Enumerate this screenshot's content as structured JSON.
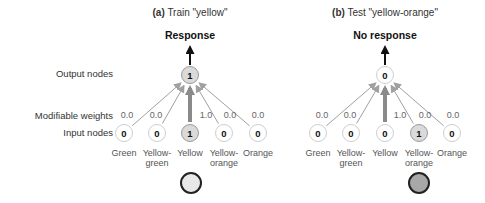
{
  "row_labels": {
    "output_nodes": "Output nodes",
    "modifiable_weights": "Modifiable weights",
    "input_nodes": "Input nodes"
  },
  "panels": [
    {
      "id": "a",
      "title_prefix": "(a)",
      "title_text": "Train \"yellow\"",
      "response": "Response",
      "output_value": "1",
      "output_active": true,
      "inputs": [
        {
          "label": "Green",
          "value": "0",
          "weight": "0.0",
          "active": false
        },
        {
          "label": "Yellow-\ngreen",
          "value": "0",
          "weight": "0.0",
          "active": false
        },
        {
          "label": "Yellow",
          "value": "1",
          "weight": "1.0",
          "active": true
        },
        {
          "label": "Yellow-\norange",
          "value": "0",
          "weight": "0.0",
          "active": false
        },
        {
          "label": "Orange",
          "value": "0",
          "weight": "0.0",
          "active": false
        }
      ],
      "stimulus_color": "#e8e8e8"
    },
    {
      "id": "b",
      "title_prefix": "(b)",
      "title_text": "Test \"yellow-orange\"",
      "response": "No response",
      "output_value": "0",
      "output_active": false,
      "inputs": [
        {
          "label": "Green",
          "value": "0",
          "weight": "0.0",
          "active": false
        },
        {
          "label": "Yellow-\ngreen",
          "value": "0",
          "weight": "0.0",
          "active": false
        },
        {
          "label": "Yellow",
          "value": "0",
          "weight": "1.0",
          "active": false
        },
        {
          "label": "Yellow-\norange",
          "value": "1",
          "weight": "0.0",
          "active": true
        },
        {
          "label": "Orange",
          "value": "0",
          "weight": "0.0",
          "active": false
        }
      ],
      "stimulus_color": "#a8a8a8"
    }
  ],
  "colors": {
    "thin_arrow": "#a0a0a0",
    "strong_arrow": "#8a8a8a",
    "response_arrow": "#111111",
    "active_node_fill": "#dadada",
    "node_border": "#cfcfcf"
  }
}
